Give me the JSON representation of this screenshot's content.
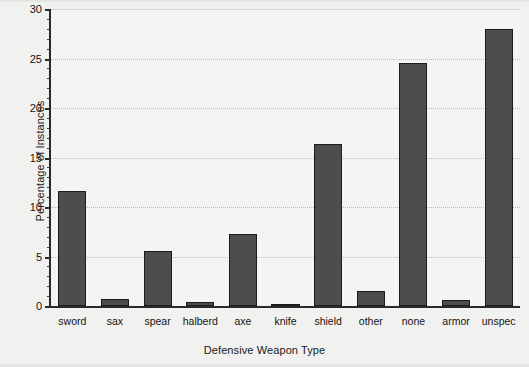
{
  "chart_data": {
    "type": "bar",
    "title": "",
    "xlabel": "Defensive Weapon Type",
    "ylabel": "Percentage of Instances",
    "categories": [
      "sword",
      "sax",
      "spear",
      "halberd",
      "axe",
      "knife",
      "shield",
      "other",
      "none",
      "armor",
      "unspec"
    ],
    "values": [
      11.6,
      0.7,
      5.6,
      0.4,
      7.3,
      0.15,
      16.4,
      1.5,
      24.5,
      0.6,
      28.0
    ],
    "ylim": [
      0,
      30
    ],
    "yticks": [
      0,
      5,
      10,
      15,
      20,
      25,
      30
    ],
    "ytick_labels": [
      "0",
      "5",
      "10",
      "15",
      "20",
      "25",
      "30"
    ],
    "yminor_ticks": [
      1,
      2,
      3,
      4,
      6,
      7,
      8,
      9,
      11,
      12,
      13,
      14,
      16,
      17,
      18,
      19,
      21,
      22,
      23,
      24,
      26,
      27,
      28,
      29
    ],
    "grid": true,
    "grid_axis": "y",
    "grid_style": "dotted",
    "legend": null,
    "bar_color": "#4d4d4d",
    "bar_edge_color": "#1c1c1c",
    "background_color": "#f4f4f2",
    "axis_color": "#2a2a2a"
  }
}
